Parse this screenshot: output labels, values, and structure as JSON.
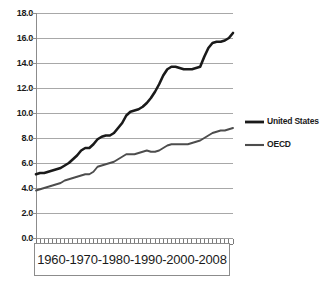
{
  "chart_data": {
    "type": "line",
    "title": "",
    "xlabel": "1960-1970-1980-1990-2000-2008",
    "ylabel": "",
    "ylim": [
      0.0,
      18.0
    ],
    "ytick_labels": [
      "18.0",
      "16.0",
      "14.0",
      "12.0",
      "10.0",
      "8.0",
      "6.0",
      "4.0",
      "2.0",
      "0.0"
    ],
    "ytick_values": [
      18.0,
      16.0,
      14.0,
      12.0,
      10.0,
      8.0,
      6.0,
      4.0,
      2.0,
      0.0
    ],
    "grid": true,
    "legend_position": "right",
    "xlim": [
      1960,
      2008
    ],
    "x": [
      1960,
      1961,
      1962,
      1963,
      1964,
      1965,
      1966,
      1967,
      1968,
      1969,
      1970,
      1971,
      1972,
      1973,
      1974,
      1975,
      1976,
      1977,
      1978,
      1979,
      1980,
      1981,
      1982,
      1983,
      1984,
      1985,
      1986,
      1987,
      1988,
      1989,
      1990,
      1991,
      1992,
      1993,
      1994,
      1995,
      1996,
      1997,
      1998,
      1999,
      2000,
      2001,
      2002,
      2003,
      2004,
      2005,
      2006,
      2007,
      2008
    ],
    "series": [
      {
        "name": "United States",
        "color": "#1a1a1a",
        "width": 2.6,
        "values": [
          5.1,
          5.2,
          5.2,
          5.3,
          5.4,
          5.5,
          5.6,
          5.8,
          6.0,
          6.3,
          6.6,
          7.0,
          7.2,
          7.2,
          7.5,
          7.9,
          8.1,
          8.2,
          8.2,
          8.4,
          8.8,
          9.2,
          9.8,
          10.1,
          10.2,
          10.3,
          10.5,
          10.8,
          11.2,
          11.7,
          12.3,
          13.0,
          13.5,
          13.7,
          13.7,
          13.6,
          13.5,
          13.5,
          13.5,
          13.6,
          13.7,
          14.5,
          15.2,
          15.6,
          15.7,
          15.7,
          15.8,
          16.0,
          16.4
        ]
      },
      {
        "name": "OECD",
        "color": "#4d4d4d",
        "width": 1.9,
        "values": [
          3.8,
          3.9,
          4.0,
          4.1,
          4.2,
          4.3,
          4.4,
          4.6,
          4.7,
          4.8,
          4.9,
          5.0,
          5.1,
          5.1,
          5.3,
          5.7,
          5.8,
          5.9,
          6.0,
          6.1,
          6.3,
          6.5,
          6.7,
          6.7,
          6.7,
          6.8,
          6.9,
          7.0,
          6.9,
          6.9,
          7.0,
          7.2,
          7.4,
          7.5,
          7.5,
          7.5,
          7.5,
          7.5,
          7.6,
          7.7,
          7.8,
          8.0,
          8.2,
          8.4,
          8.5,
          8.6,
          8.6,
          8.7,
          8.8
        ]
      }
    ]
  },
  "legend": {
    "items": [
      {
        "label": "United States"
      },
      {
        "label": "OECD"
      }
    ]
  },
  "axis": {
    "x_label_box_text": "1960-1970-1980-1990-2000-2008"
  }
}
